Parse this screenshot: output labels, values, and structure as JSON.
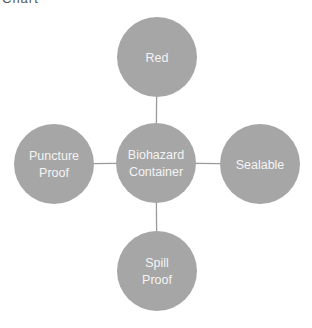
{
  "caption": "Chart",
  "diagram": {
    "type": "radial-cycle",
    "colors": {
      "node_fill": "#a6a6a6",
      "connector": "#9a9a9a",
      "label": "#f4f4f4"
    },
    "center": {
      "id": "center",
      "lines": [
        "Biohazard",
        "Container"
      ]
    },
    "nodes": [
      {
        "id": "top",
        "position": "top",
        "lines": [
          "Red"
        ]
      },
      {
        "id": "right",
        "position": "right",
        "lines": [
          "Sealable"
        ]
      },
      {
        "id": "bottom",
        "position": "bottom",
        "lines": [
          "Spill",
          "Proof"
        ]
      },
      {
        "id": "left",
        "position": "left",
        "lines": [
          "Puncture",
          "Proof"
        ]
      }
    ]
  }
}
